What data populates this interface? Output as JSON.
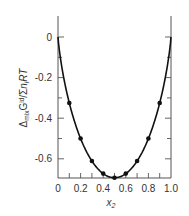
{
  "chart_data": {
    "type": "line",
    "title": "",
    "xlabel": "x2",
    "ylabel": "Δmix G^id / Σi ni RT",
    "xlim": [
      0,
      1.0
    ],
    "ylim": [
      -0.7,
      0.08
    ],
    "x_ticks": [
      "0",
      "0.2",
      "0.4",
      "0.6",
      "0.8",
      "1.0"
    ],
    "y_ticks": [
      "0",
      "-0.2",
      "-0.4",
      "-0.6"
    ],
    "grid": false,
    "series": [
      {
        "name": "ideal mixing curve",
        "style": "line",
        "x": [
          0,
          0.02,
          0.05,
          0.1,
          0.15,
          0.2,
          0.25,
          0.3,
          0.35,
          0.4,
          0.45,
          0.5,
          0.55,
          0.6,
          0.65,
          0.7,
          0.75,
          0.8,
          0.85,
          0.9,
          0.95,
          0.98,
          1.0
        ],
        "values": [
          0,
          -0.098,
          -0.199,
          -0.325,
          -0.423,
          -0.5,
          -0.562,
          -0.611,
          -0.647,
          -0.673,
          -0.688,
          -0.693,
          -0.688,
          -0.673,
          -0.647,
          -0.611,
          -0.562,
          -0.5,
          -0.423,
          -0.325,
          -0.199,
          -0.098,
          0
        ]
      },
      {
        "name": "data points",
        "style": "markers",
        "x": [
          0.1,
          0.2,
          0.3,
          0.4,
          0.5,
          0.6,
          0.7,
          0.8,
          0.9
        ],
        "values": [
          -0.325,
          -0.5,
          -0.611,
          -0.673,
          -0.693,
          -0.673,
          -0.611,
          -0.5,
          -0.325
        ]
      }
    ]
  },
  "labels": {
    "x_axis": "x",
    "x_axis_sub": "2",
    "y_axis_delta": "Δ",
    "y_axis_mix": "mix",
    "y_axis_G": "G",
    "y_axis_id": "id",
    "y_axis_slash": "/",
    "y_axis_sigma": "Σ",
    "y_axis_i": "i",
    "y_axis_n": "n",
    "y_axis_ni": "i",
    "y_axis_RT": "RT"
  },
  "colors": {
    "axis": "#555555",
    "curve": "#111111",
    "text": "#333333"
  }
}
